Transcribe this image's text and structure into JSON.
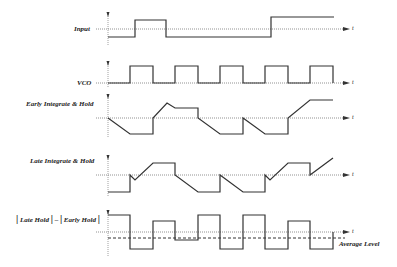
{
  "diagram": {
    "type": "timing-waveforms",
    "time_axis_label": "t",
    "traces": [
      {
        "id": "input",
        "label": "Input"
      },
      {
        "id": "vco",
        "label": "VCO"
      },
      {
        "id": "early",
        "label": "Early Integrate & Hold"
      },
      {
        "id": "late",
        "label": "Late Integrate & Hold"
      },
      {
        "id": "diff",
        "label_parts": [
          "|",
          "Late Hold",
          "|",
          "–",
          "|",
          "Early Hold",
          "|"
        ]
      }
    ],
    "annotations": {
      "average_level": "Average Level"
    },
    "colors": {
      "waveform": "#333333",
      "axis": "#777777",
      "background": "#ffffff"
    }
  }
}
